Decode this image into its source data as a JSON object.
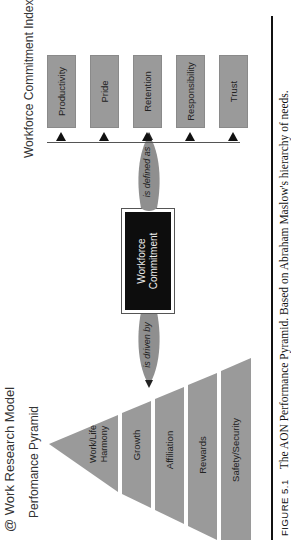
{
  "header": {
    "title": "@ Work Research Model",
    "pyramid_title": "Perfomance Pyramid",
    "index_title": "Workforce Commitment Index"
  },
  "pyramid": {
    "levels": [
      {
        "label": "Work/Life Harmony"
      },
      {
        "label": "Growth"
      },
      {
        "label": "Affiliation"
      },
      {
        "label": "Rewards"
      },
      {
        "label": "Safety/Security"
      }
    ],
    "fill_color": "#9a9a9a"
  },
  "connectors": {
    "driven_by": "is driven by",
    "defined_as": "is defined as"
  },
  "center": {
    "label": "Workforce Commitment"
  },
  "index_items": [
    {
      "label": "Productivity"
    },
    {
      "label": "Pride"
    },
    {
      "label": "Retention"
    },
    {
      "label": "Responsibility"
    },
    {
      "label": "Trust"
    }
  ],
  "caption": {
    "figure": "FIGURE 5.1",
    "text": "The AON Performance Pyramid. Based on Abraham Maslow's hierarchy of needs."
  }
}
